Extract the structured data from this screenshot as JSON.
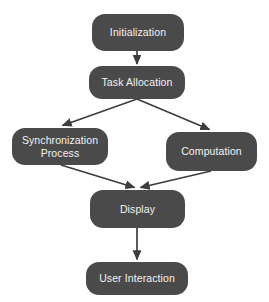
{
  "diagram": {
    "type": "flowchart",
    "background_color": "#ffffff",
    "node_fill_color": "#4a4a4a",
    "node_text_color": "#f2f2f2",
    "edge_color": "#3d3d3d",
    "nodes": [
      {
        "id": "initialization",
        "label": "Initialization",
        "x": 92,
        "y": 14,
        "width": 92,
        "height": 37,
        "font_size": 10.5
      },
      {
        "id": "task-allocation",
        "label": "Task Allocation",
        "x": 89,
        "y": 66,
        "width": 96,
        "height": 33,
        "font_size": 10.5
      },
      {
        "id": "synchronization-process",
        "label": "Synchronization\nProcess",
        "x": 12,
        "y": 128,
        "width": 96,
        "height": 37,
        "font_size": 10.5
      },
      {
        "id": "computation",
        "label": "Computation",
        "x": 166,
        "y": 132,
        "width": 91,
        "height": 39,
        "font_size": 10.5
      },
      {
        "id": "display",
        "label": "Display",
        "x": 90,
        "y": 190,
        "width": 95,
        "height": 38,
        "font_size": 10.5
      },
      {
        "id": "user-interaction",
        "label": "User Interaction",
        "x": 86,
        "y": 262,
        "width": 102,
        "height": 33,
        "font_size": 10.5
      }
    ],
    "edges": [
      {
        "id": "initialization-to-task-allocation",
        "from": "initialization",
        "to": "task-allocation",
        "x1": 137,
        "y1": 51,
        "x2": 137,
        "y2": 65
      },
      {
        "id": "task-allocation-to-synchronization-process",
        "from": "task-allocation",
        "to": "synchronization-process",
        "x1": 137,
        "y1": 99,
        "x2": 61,
        "y2": 127
      },
      {
        "id": "task-allocation-to-computation",
        "from": "task-allocation",
        "to": "computation",
        "x1": 137,
        "y1": 99,
        "x2": 211,
        "y2": 131
      },
      {
        "id": "synchronization-process-to-display",
        "from": "synchronization-process",
        "to": "display",
        "x1": 61,
        "y1": 165,
        "x2": 136,
        "y2": 189
      },
      {
        "id": "computation-to-display",
        "from": "computation",
        "to": "display",
        "x1": 211,
        "y1": 171,
        "x2": 139,
        "y2": 189
      },
      {
        "id": "display-to-user-interaction",
        "from": "display",
        "to": "user-interaction",
        "x1": 137,
        "y1": 228,
        "x2": 137,
        "y2": 261
      }
    ]
  }
}
